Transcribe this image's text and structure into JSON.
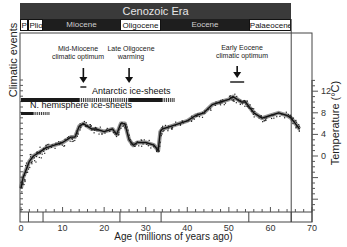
{
  "chart_data": {
    "type": "line",
    "title": "Cenozoic Era",
    "xlabel": "Age (millions of years ago)",
    "ylabel_left": "Climatic events",
    "ylabel_right": "Temperature (°C)",
    "xlim": [
      0,
      70
    ],
    "ylim_right": [
      -8,
      14
    ],
    "x_ticks": [
      0,
      10,
      20,
      30,
      40,
      50,
      60,
      70
    ],
    "y_ticks_right": [
      0,
      4,
      8,
      12
    ],
    "grid": false,
    "epochs": [
      {
        "name": "Plio",
        "start": 1.8,
        "end": 5.3,
        "style": "light"
      },
      {
        "name": "Miocene",
        "start": 5.3,
        "end": 23.8,
        "style": "dark"
      },
      {
        "name": "Oligocene",
        "start": 23.8,
        "end": 33.7,
        "style": "light"
      },
      {
        "name": "Eocene",
        "start": 33.7,
        "end": 54.8,
        "style": "dark"
      },
      {
        "name": "Palaeocene",
        "start": 54.8,
        "end": 65,
        "style": "light"
      }
    ],
    "epoch_boundaries": [
      1.8,
      5.3,
      23.8,
      33.7,
      54.8,
      65
    ],
    "annotations": [
      {
        "text": "Mid-Miocene climatic optimum",
        "x": 15
      },
      {
        "text": "Late Oligocene warming",
        "x": 26
      },
      {
        "text": "Early Eocene climatic optimum",
        "x": 52
      }
    ],
    "ice_sheets": [
      {
        "name": "Antarctic ice-sheets",
        "full": [
          [
            0,
            14
          ],
          [
            26,
            34
          ]
        ],
        "partial": [
          [
            14,
            26
          ],
          [
            34,
            37
          ]
        ]
      },
      {
        "name": "N. hemisphere ice-sheets",
        "full": [
          [
            0,
            3
          ]
        ],
        "partial": [
          [
            3,
            7
          ]
        ]
      }
    ],
    "series": [
      {
        "name": "Deep-sea temperature",
        "x": [
          0,
          0.5,
          1,
          2,
          3,
          4,
          5,
          6,
          8,
          10,
          12,
          13,
          14,
          15,
          16,
          17,
          18,
          20,
          22,
          23,
          24,
          25,
          26,
          27,
          28,
          30,
          32,
          33,
          33.5,
          34,
          36,
          38,
          40,
          42,
          44,
          46,
          48,
          50,
          51,
          52,
          53,
          54,
          55,
          56,
          58,
          60,
          62,
          64,
          65,
          66,
          67
        ],
        "values": [
          -6,
          -4,
          -3,
          -1,
          0,
          0.5,
          1,
          1.5,
          2,
          2.5,
          3.5,
          3.5,
          5.5,
          6,
          5.5,
          5,
          5,
          4.5,
          5,
          4,
          6,
          6,
          3,
          2,
          2.5,
          2.5,
          2,
          1,
          4.5,
          5,
          5.5,
          6,
          6.5,
          7.5,
          8,
          9.5,
          10,
          10.5,
          11,
          10.5,
          10,
          10,
          9,
          8,
          7,
          7.5,
          8,
          7.5,
          7,
          6,
          5
        ]
      }
    ]
  },
  "labels": {
    "era": "Cenozoic Era",
    "ylabel_left": "Climatic events",
    "ylabel_right": "Temperature (°C)",
    "xlabel": "Age (millions of years ago)",
    "annot_mid_miocene": "Mid-Miocene climatic optimum",
    "annot_late_oligocene": "Late Oligocene warming",
    "annot_early_eocene": "Early Eocene climatic optimum",
    "antarctic": "Antarctic ice-sheets",
    "nhemisphere": "N. hemisphere ice-sheets"
  }
}
